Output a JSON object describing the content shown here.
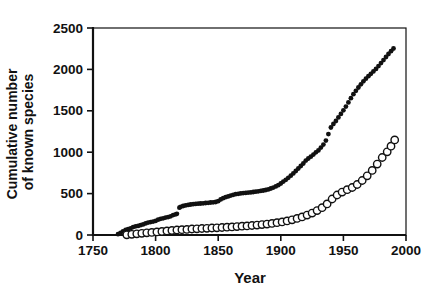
{
  "chart_data": {
    "type": "scatter",
    "title": "",
    "xlabel": "Year",
    "ylabel_line1": "Cumulative number",
    "ylabel_line2": "of known species",
    "xlim": [
      1750,
      2000
    ],
    "ylim": [
      0,
      2500
    ],
    "x_ticks": [
      "1750",
      "1800",
      "1850",
      "1900",
      "1950",
      "2000"
    ],
    "y_ticks": [
      "0",
      "500",
      "1000",
      "1500",
      "2000",
      "2500"
    ],
    "grid": false,
    "legend_position": "none",
    "ink_color": "#111111",
    "background_color": "#ffffff",
    "series": [
      {
        "name": "filled",
        "marker": "filled-circle",
        "color": "#111111",
        "points": [
          [
            1770,
            10
          ],
          [
            1772,
            25
          ],
          [
            1774,
            45
          ],
          [
            1776,
            60
          ],
          [
            1778,
            70
          ],
          [
            1780,
            80
          ],
          [
            1782,
            95
          ],
          [
            1784,
            105
          ],
          [
            1786,
            110
          ],
          [
            1788,
            118
          ],
          [
            1790,
            128
          ],
          [
            1792,
            140
          ],
          [
            1794,
            150
          ],
          [
            1796,
            156
          ],
          [
            1798,
            162
          ],
          [
            1800,
            170
          ],
          [
            1802,
            185
          ],
          [
            1804,
            196
          ],
          [
            1806,
            202
          ],
          [
            1808,
            210
          ],
          [
            1810,
            216
          ],
          [
            1812,
            226
          ],
          [
            1814,
            240
          ],
          [
            1816,
            250
          ],
          [
            1817,
            256
          ],
          [
            1819,
            330
          ],
          [
            1820,
            340
          ],
          [
            1822,
            350
          ],
          [
            1824,
            358
          ],
          [
            1826,
            364
          ],
          [
            1828,
            368
          ],
          [
            1830,
            372
          ],
          [
            1832,
            375
          ],
          [
            1834,
            378
          ],
          [
            1836,
            380
          ],
          [
            1838,
            383
          ],
          [
            1840,
            386
          ],
          [
            1842,
            389
          ],
          [
            1844,
            392
          ],
          [
            1846,
            395
          ],
          [
            1848,
            399
          ],
          [
            1850,
            408
          ],
          [
            1852,
            430
          ],
          [
            1854,
            445
          ],
          [
            1856,
            456
          ],
          [
            1858,
            466
          ],
          [
            1860,
            476
          ],
          [
            1862,
            486
          ],
          [
            1864,
            493
          ],
          [
            1866,
            498
          ],
          [
            1868,
            502
          ],
          [
            1870,
            506
          ],
          [
            1872,
            509
          ],
          [
            1874,
            512
          ],
          [
            1876,
            515
          ],
          [
            1878,
            519
          ],
          [
            1880,
            523
          ],
          [
            1882,
            528
          ],
          [
            1884,
            533
          ],
          [
            1886,
            538
          ],
          [
            1888,
            543
          ],
          [
            1890,
            551
          ],
          [
            1892,
            561
          ],
          [
            1894,
            573
          ],
          [
            1896,
            587
          ],
          [
            1898,
            602
          ],
          [
            1900,
            622
          ],
          [
            1902,
            645
          ],
          [
            1904,
            667
          ],
          [
            1906,
            691
          ],
          [
            1908,
            716
          ],
          [
            1910,
            744
          ],
          [
            1912,
            773
          ],
          [
            1914,
            803
          ],
          [
            1916,
            833
          ],
          [
            1918,
            864
          ],
          [
            1920,
            898
          ],
          [
            1922,
            924
          ],
          [
            1924,
            946
          ],
          [
            1926,
            971
          ],
          [
            1928,
            999
          ],
          [
            1930,
            1022
          ],
          [
            1932,
            1056
          ],
          [
            1934,
            1092
          ],
          [
            1936,
            1140
          ],
          [
            1938,
            1218
          ],
          [
            1940,
            1298
          ],
          [
            1942,
            1340
          ],
          [
            1944,
            1377
          ],
          [
            1946,
            1420
          ],
          [
            1948,
            1462
          ],
          [
            1950,
            1506
          ],
          [
            1952,
            1551
          ],
          [
            1954,
            1601
          ],
          [
            1956,
            1652
          ],
          [
            1958,
            1700
          ],
          [
            1960,
            1742
          ],
          [
            1962,
            1782
          ],
          [
            1964,
            1820
          ],
          [
            1966,
            1856
          ],
          [
            1968,
            1888
          ],
          [
            1970,
            1918
          ],
          [
            1972,
            1947
          ],
          [
            1974,
            1976
          ],
          [
            1976,
            2006
          ],
          [
            1978,
            2040
          ],
          [
            1980,
            2076
          ],
          [
            1982,
            2112
          ],
          [
            1984,
            2150
          ],
          [
            1986,
            2186
          ],
          [
            1988,
            2220
          ],
          [
            1990,
            2252
          ]
        ]
      },
      {
        "name": "open",
        "marker": "open-circle",
        "color": "#111111",
        "fill": "#ffffff",
        "points": [
          [
            1777,
            2
          ],
          [
            1781,
            8
          ],
          [
            1785,
            14
          ],
          [
            1789,
            20
          ],
          [
            1793,
            26
          ],
          [
            1797,
            32
          ],
          [
            1801,
            38
          ],
          [
            1805,
            44
          ],
          [
            1809,
            50
          ],
          [
            1813,
            55
          ],
          [
            1817,
            60
          ],
          [
            1821,
            64
          ],
          [
            1825,
            68
          ],
          [
            1829,
            72
          ],
          [
            1833,
            75
          ],
          [
            1837,
            78
          ],
          [
            1841,
            81
          ],
          [
            1845,
            84
          ],
          [
            1849,
            87
          ],
          [
            1853,
            90
          ],
          [
            1857,
            94
          ],
          [
            1861,
            98
          ],
          [
            1865,
            102
          ],
          [
            1869,
            106
          ],
          [
            1873,
            110
          ],
          [
            1877,
            115
          ],
          [
            1881,
            120
          ],
          [
            1885,
            126
          ],
          [
            1889,
            132
          ],
          [
            1893,
            140
          ],
          [
            1897,
            148
          ],
          [
            1901,
            158
          ],
          [
            1905,
            170
          ],
          [
            1909,
            184
          ],
          [
            1913,
            200
          ],
          [
            1917,
            218
          ],
          [
            1921,
            240
          ],
          [
            1925,
            265
          ],
          [
            1929,
            295
          ],
          [
            1933,
            330
          ],
          [
            1937,
            375
          ],
          [
            1941,
            435
          ],
          [
            1945,
            483
          ],
          [
            1949,
            518
          ],
          [
            1953,
            547
          ],
          [
            1957,
            574
          ],
          [
            1961,
            610
          ],
          [
            1965,
            658
          ],
          [
            1969,
            715
          ],
          [
            1973,
            780
          ],
          [
            1977,
            856
          ],
          [
            1981,
            936
          ],
          [
            1985,
            1005
          ],
          [
            1988,
            1072
          ],
          [
            1991,
            1148
          ]
        ]
      }
    ]
  }
}
